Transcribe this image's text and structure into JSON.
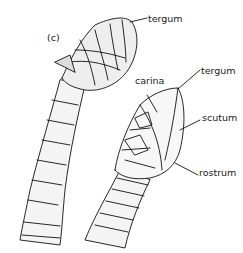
{
  "figure": {
    "panel_label": "(c)",
    "labels": {
      "tergum_top": "tergum",
      "carina": "carina",
      "tergum_right": "tergum",
      "scutum": "scutum",
      "rostrum": "rostrum"
    }
  }
}
